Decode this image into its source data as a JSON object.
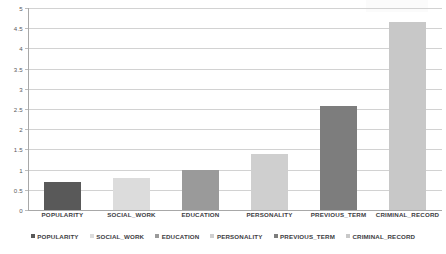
{
  "chart_data": {
    "type": "bar",
    "title": "",
    "subtitle": "",
    "xlabel": "",
    "ylabel": "",
    "categories": [
      "POPULARITY",
      "SOCIAL_WORK",
      "EDUCATION",
      "PERSONALITY",
      "PREVIOUS_TERM",
      "CRIMINAL_RECORD"
    ],
    "values": [
      0.7,
      0.8,
      1.0,
      1.38,
      2.57,
      4.65
    ],
    "series": [
      {
        "name": "",
        "values": [
          0.7,
          0.8,
          1.0,
          1.38,
          2.57,
          4.65
        ]
      }
    ],
    "ylim": [
      0,
      5
    ],
    "ytick_step": 0.5,
    "ytick_labels": [
      "0",
      "0.5",
      "1",
      "1.5",
      "2",
      "2.5",
      "3",
      "3.5",
      "4",
      "4.5",
      "5"
    ],
    "ytick_values": [
      0,
      0.5,
      1,
      1.5,
      2,
      2.5,
      3,
      3.5,
      4,
      4.5,
      5
    ],
    "grid": true,
    "grid_axis": "y",
    "legend_position": "bottom",
    "legend": [
      {
        "label": "POPULARITY",
        "color": "#595959"
      },
      {
        "label": "SOCIAL_WORK",
        "color": "#dcdcdc"
      },
      {
        "label": "EDUCATION",
        "color": "#9a9a9a"
      },
      {
        "label": "PERSONALITY",
        "color": "#cfcfcf"
      },
      {
        "label": "PREVIOUS_TERM",
        "color": "#7d7d7d"
      },
      {
        "label": "CRIMINAL_RECORD",
        "color": "#c8c8c8"
      }
    ],
    "bar_colors": [
      "#595959",
      "#dcdcdc",
      "#9a9a9a",
      "#cfcfcf",
      "#7d7d7d",
      "#c8c8c8"
    ],
    "colors": {
      "background": "#ffffff",
      "gridline": "#d2d2d2",
      "axis": "#a8a8a8",
      "text": "#3d3d3f",
      "tick_text": "#59595b"
    }
  }
}
